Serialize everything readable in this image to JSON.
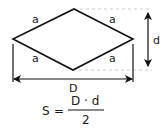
{
  "diagram": {
    "side_labels": [
      "a",
      "a",
      "a",
      "a"
    ],
    "long_diagonal_label": "D",
    "short_diagonal_label": "d",
    "formula": {
      "lhs": "S",
      "equals": "=",
      "numerator": "D · d",
      "denominator": "2"
    },
    "colors": {
      "stroke": "#111111",
      "guide": "#c8c8c8",
      "background": "#ffffff"
    }
  }
}
